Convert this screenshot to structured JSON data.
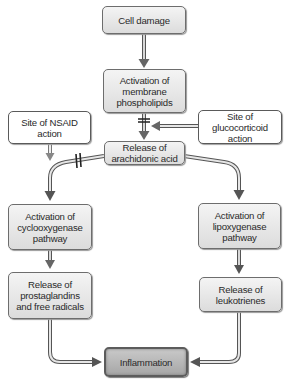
{
  "diagram": {
    "nodes": {
      "cell_damage": "Cell damage",
      "membrane": [
        "Activation of",
        "membrane",
        "phospholipids"
      ],
      "nsaid": [
        "Site of NSAID",
        "action"
      ],
      "glucocorticoid": [
        "Site of",
        "glucocorticoid action"
      ],
      "arachidonic": [
        "Release of",
        "arachidonic acid"
      ],
      "cyclooxygenase": [
        "Activation of",
        "cyclooxygenase",
        "pathway"
      ],
      "lipoxygenase": [
        "Activation of",
        "lipoxygenase",
        "pathway"
      ],
      "prostaglandins": [
        "Release of",
        "prostaglandins",
        "and free radicals"
      ],
      "leukotrienes": [
        "Release of",
        "leukotrienes"
      ],
      "inflammation": "Inflammation"
    },
    "edges": [
      {
        "from": "cell_damage",
        "to": "membrane"
      },
      {
        "from": "membrane",
        "to": "arachidonic",
        "blocked_by": "glucocorticoid"
      },
      {
        "from": "nsaid",
        "to": "cyclooxygenase_branch"
      },
      {
        "from": "arachidonic",
        "to": "cyclooxygenase",
        "blocked_by": "nsaid"
      },
      {
        "from": "arachidonic",
        "to": "lipoxygenase"
      },
      {
        "from": "cyclooxygenase",
        "to": "prostaglandins"
      },
      {
        "from": "lipoxygenase",
        "to": "leukotrienes"
      },
      {
        "from": "prostaglandins",
        "to": "inflammation"
      },
      {
        "from": "leukotrienes",
        "to": "inflammation"
      }
    ]
  }
}
